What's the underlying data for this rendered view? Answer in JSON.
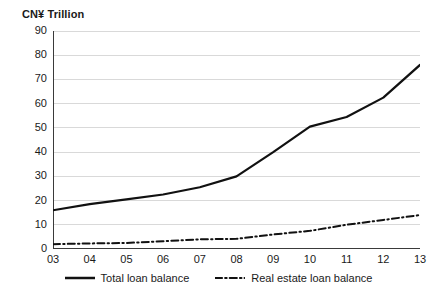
{
  "chart_data": {
    "type": "line",
    "title": "CN¥ Trillion",
    "xlabel": "",
    "ylabel": "CN¥ Trillion",
    "categories": [
      "03",
      "04",
      "05",
      "06",
      "07",
      "08",
      "09",
      "10",
      "11",
      "12",
      "13"
    ],
    "x_tick_labels": [
      "03",
      "04",
      "05",
      "06",
      "07",
      "08",
      "09",
      "10",
      "11",
      "12",
      "13"
    ],
    "y_tick_labels": [
      "0",
      "10",
      "20",
      "30",
      "40",
      "50",
      "60",
      "70",
      "80",
      "90"
    ],
    "y_ticks": [
      0,
      10,
      20,
      30,
      40,
      50,
      60,
      70,
      80,
      90
    ],
    "ylim": [
      0,
      90
    ],
    "grid": "horizontal",
    "legend_position": "bottom-center",
    "series": [
      {
        "name": "Total loan balance",
        "style": "solid",
        "color": "#111111",
        "values": [
          16,
          18.5,
          20.5,
          22.5,
          25.5,
          30,
          40,
          50.5,
          54.5,
          62.5,
          76
        ]
      },
      {
        "name": "Real estate loan balance",
        "style": "dash-dot",
        "color": "#111111",
        "values": [
          2,
          2.3,
          2.5,
          3.2,
          4,
          4.2,
          6,
          7.5,
          10,
          12,
          14
        ]
      }
    ]
  },
  "legend": {
    "items": [
      {
        "label": "Total loan balance",
        "style": "solid"
      },
      {
        "label": "Real estate loan balance",
        "style": "dash-dot"
      }
    ]
  },
  "colors": {
    "series_line": "#111111",
    "gridline": "#d9d9d9",
    "axis": "#3a3a3a",
    "text": "#1a1a1a",
    "background": "#ffffff"
  }
}
